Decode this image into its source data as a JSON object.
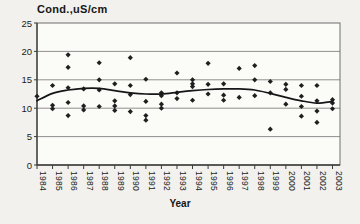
{
  "figure": {
    "title": "Cond.,uS/cm",
    "x_axis_label": "Year"
  },
  "chart_data": {
    "type": "scatter",
    "title": "Cond.,uS/cm",
    "xlabel": "Year",
    "ylabel": "Cond., uS/cm",
    "marker": "diamond",
    "grid": "horizontal",
    "legend": "none",
    "xlim": [
      1984,
      2003
    ],
    "ylim": [
      0,
      25
    ],
    "x_ticks": [
      1984,
      1985,
      1986,
      1987,
      1988,
      1989,
      1990,
      1991,
      1992,
      1993,
      1994,
      1995,
      1996,
      1997,
      1998,
      1999,
      2000,
      2001,
      2002,
      2003
    ],
    "y_ticks": [
      0,
      5,
      10,
      15,
      20,
      25
    ],
    "series": [
      {
        "name": "conductivity-observations",
        "type": "scatter",
        "points": [
          [
            1984,
            12.1
          ],
          [
            1985,
            14.0
          ],
          [
            1985,
            10.5
          ],
          [
            1985,
            9.9
          ],
          [
            1986,
            19.4
          ],
          [
            1986,
            17.2
          ],
          [
            1986,
            13.6
          ],
          [
            1986,
            11.0
          ],
          [
            1986,
            8.7
          ],
          [
            1987,
            13.4
          ],
          [
            1987,
            10.4
          ],
          [
            1987,
            9.7
          ],
          [
            1988,
            18.0
          ],
          [
            1988,
            15.0
          ],
          [
            1988,
            13.2
          ],
          [
            1988,
            10.3
          ],
          [
            1989,
            14.3
          ],
          [
            1989,
            11.3
          ],
          [
            1989,
            10.4
          ],
          [
            1989,
            9.6
          ],
          [
            1990,
            18.9
          ],
          [
            1990,
            14.0
          ],
          [
            1990,
            12.4
          ],
          [
            1990,
            9.4
          ],
          [
            1991,
            15.1
          ],
          [
            1991,
            11.2
          ],
          [
            1991,
            8.7
          ],
          [
            1991,
            7.9
          ],
          [
            1992,
            12.7
          ],
          [
            1992,
            12.2
          ],
          [
            1992,
            10.7
          ],
          [
            1992,
            10.0
          ],
          [
            1993,
            16.2
          ],
          [
            1993,
            12.7
          ],
          [
            1993,
            11.7
          ],
          [
            1994,
            15.0
          ],
          [
            1994,
            14.3
          ],
          [
            1994,
            13.8
          ],
          [
            1994,
            11.4
          ],
          [
            1995,
            17.9
          ],
          [
            1995,
            14.2
          ],
          [
            1995,
            12.5
          ],
          [
            1996,
            14.3
          ],
          [
            1996,
            12.3
          ],
          [
            1996,
            11.4
          ],
          [
            1997,
            17.0
          ],
          [
            1997,
            11.9
          ],
          [
            1998,
            17.5
          ],
          [
            1998,
            15.0
          ],
          [
            1998,
            12.2
          ],
          [
            1999,
            14.7
          ],
          [
            1999,
            12.7
          ],
          [
            1999,
            6.3
          ],
          [
            2000,
            14.2
          ],
          [
            2000,
            13.3
          ],
          [
            2000,
            10.7
          ],
          [
            2001,
            14.0
          ],
          [
            2001,
            12.1
          ],
          [
            2001,
            10.3
          ],
          [
            2001,
            8.6
          ],
          [
            2002,
            14.0
          ],
          [
            2002,
            11.3
          ],
          [
            2002,
            9.5
          ],
          [
            2002,
            7.5
          ],
          [
            2003,
            11.5
          ],
          [
            2003,
            10.9
          ],
          [
            2003,
            9.9
          ]
        ]
      },
      {
        "name": "trend-line",
        "type": "line",
        "x": [
          1984,
          1985,
          1986,
          1987,
          1988,
          1989,
          1990,
          1991,
          1992,
          1993,
          1994,
          1995,
          1996,
          1997,
          1998,
          1999,
          2000,
          2001,
          2002,
          2003
        ],
        "y": [
          11.3,
          12.6,
          13.2,
          13.5,
          13.5,
          13.1,
          12.7,
          12.5,
          12.5,
          12.8,
          13.1,
          13.3,
          13.4,
          13.4,
          13.2,
          12.6,
          11.9,
          11.3,
          10.9,
          11.2
        ]
      }
    ],
    "colors": {
      "background": "#f2f1ed",
      "plot_background": "#fbfbf8",
      "gridline": "#8f8f8f",
      "border": "#6f6f6f",
      "axis": "#3c3c3c",
      "marker": "#1f1f1f",
      "trend": "#161616",
      "text": "#1c1c1c"
    }
  }
}
